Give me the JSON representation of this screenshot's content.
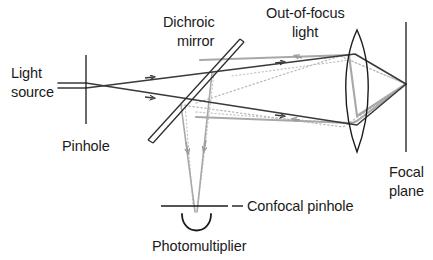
{
  "diagram": {
    "colors": {
      "ray_dark": "#3a3a3a",
      "ray_gray": "#9a9a9a",
      "dotted_gray": "#b5b5b5",
      "optic_black": "#1b1b1b",
      "text": "#1b1b1b",
      "background": "#ffffff"
    },
    "labels": {
      "light_source_line1": "Light",
      "light_source_line2": "source",
      "pinhole": "Pinhole",
      "dichroic_line1": "Dichroic",
      "dichroic_line2": "mirror",
      "out_of_focus_line1": "Out-of-focus",
      "out_of_focus_line2": "light",
      "focal_plane_line1": "Focal",
      "focal_plane_line2": "plane",
      "confocal_pinhole": "Confocal pinhole",
      "photomultiplier": "Photomultiplier"
    },
    "components": [
      {
        "name": "light-source",
        "kind": "text-label"
      },
      {
        "name": "pinhole",
        "kind": "vertical-aperture-line"
      },
      {
        "name": "dichroic-mirror",
        "kind": "double-line-diagonal"
      },
      {
        "name": "objective-lens",
        "kind": "biconvex-lens"
      },
      {
        "name": "focal-plane",
        "kind": "vertical-line"
      },
      {
        "name": "confocal-pinhole",
        "kind": "horizontal-aperture-line"
      },
      {
        "name": "photomultiplier",
        "kind": "cup-detector"
      }
    ],
    "ray_paths": [
      {
        "name": "illumination-ray-upper",
        "style": "solid-dark",
        "direction": "rightward"
      },
      {
        "name": "illumination-ray-lower",
        "style": "solid-dark",
        "direction": "rightward"
      },
      {
        "name": "in-focus-return-upper",
        "style": "solid-gray",
        "direction": "leftward"
      },
      {
        "name": "in-focus-return-lower",
        "style": "solid-gray",
        "direction": "leftward"
      },
      {
        "name": "out-of-focus-beam",
        "style": "dotted-gray",
        "direction": "leftward"
      },
      {
        "name": "detection-ray-left",
        "style": "solid-gray",
        "direction": "downward"
      },
      {
        "name": "detection-ray-right",
        "style": "solid-gray",
        "direction": "downward"
      }
    ]
  }
}
